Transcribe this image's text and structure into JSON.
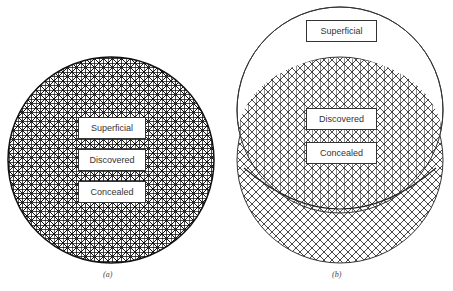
{
  "panel_a": {
    "caption": "(a)",
    "labels": [
      "Superficial",
      "Discovered",
      "Concealed"
    ]
  },
  "panel_b": {
    "caption": "(b)",
    "labels": [
      "Superficial",
      "Discovered",
      "Concealed"
    ]
  }
}
